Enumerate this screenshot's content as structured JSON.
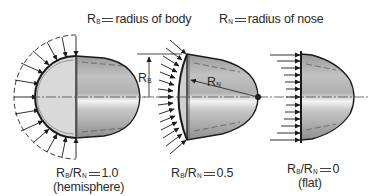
{
  "legend": {
    "body_radius": {
      "symbol": "R",
      "subscript": "B",
      "text": "radius of body"
    },
    "nose_radius": {
      "symbol": "R",
      "subscript": "N",
      "text": "radius of nose"
    }
  },
  "shapes": [
    {
      "id": "hemisphere",
      "ratio_label": {
        "a": "R",
        "a_sub": "B",
        "b": "R",
        "b_sub": "N",
        "value": "1.0"
      },
      "caption": "(hemisphere)"
    },
    {
      "id": "intermediate",
      "ratio_label": {
        "a": "R",
        "a_sub": "B",
        "b": "R",
        "b_sub": "N",
        "value": "0.5"
      },
      "caption": ""
    },
    {
      "id": "flat",
      "ratio_label": {
        "a": "R",
        "a_sub": "B",
        "b": "R",
        "b_sub": "N",
        "value": "0"
      },
      "caption": "(flat)"
    }
  ],
  "annotations": {
    "rb_dimension": {
      "symbol": "R",
      "subscript": "B"
    },
    "rn_dimension": {
      "symbol": "R",
      "subscript": "N"
    }
  },
  "colors": {
    "outline": "#1a1a1a",
    "body_light": "#d6d6d6",
    "body_mid": "#b4b4b4",
    "highlight": "#f2f2f2"
  }
}
